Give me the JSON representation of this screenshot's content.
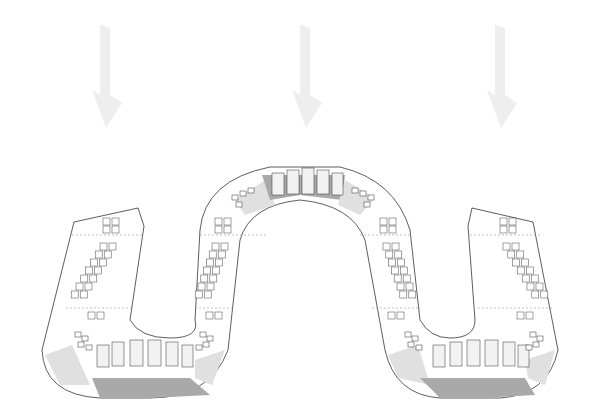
{
  "diagram": {
    "arrows": [
      {
        "name": "entry-arrow-left",
        "direction": "down"
      },
      {
        "name": "entry-arrow-center",
        "direction": "down"
      },
      {
        "name": "entry-arrow-right",
        "direction": "down"
      }
    ],
    "colors": {
      "background": "#ffffff",
      "arrow": "#eeeeee",
      "zone_dark": "#a9a9a9",
      "zone_light": "#e0e0e0",
      "outline": "#333333"
    },
    "segments": [
      {
        "name": "straight-left-1",
        "kiosk_rows": 2,
        "kiosks_per_row": 7
      },
      {
        "name": "straight-left-2",
        "kiosk_rows": 2,
        "kiosks_per_row": 7
      },
      {
        "name": "straight-right-1",
        "kiosk_rows": 2,
        "kiosks_per_row": 7
      },
      {
        "name": "straight-right-2",
        "kiosk_rows": 2,
        "kiosks_per_row": 7
      }
    ],
    "curves": [
      {
        "name": "bottom-curve-left",
        "orientation": "bottom"
      },
      {
        "name": "top-curve-center",
        "orientation": "top"
      },
      {
        "name": "bottom-curve-right",
        "orientation": "bottom"
      }
    ]
  }
}
